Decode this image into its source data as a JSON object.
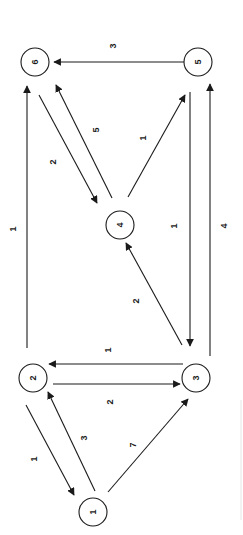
{
  "diagram": {
    "type": "directed-weighted-graph",
    "orientation": "rotated-90",
    "nodes": [
      {
        "id": "1",
        "label": "1",
        "x": 93,
        "y": 512
      },
      {
        "id": "2",
        "label": "2",
        "x": 33,
        "y": 378
      },
      {
        "id": "3",
        "label": "3",
        "x": 196,
        "y": 378
      },
      {
        "id": "4",
        "label": "4",
        "x": 120,
        "y": 225
      },
      {
        "id": "5",
        "label": "5",
        "x": 198,
        "y": 62
      },
      {
        "id": "6",
        "label": "6",
        "x": 35,
        "y": 62
      }
    ],
    "edges": [
      {
        "from": "5",
        "to": "6",
        "weight": "3",
        "x1": 184,
        "y1": 62,
        "x2": 54,
        "y2": 62,
        "lx": 113,
        "ly": 46
      },
      {
        "from": "2",
        "to": "6",
        "weight": "1",
        "x1": 27,
        "y1": 348,
        "x2": 27,
        "y2": 86,
        "lx": 13,
        "ly": 229
      },
      {
        "from": "6",
        "to": "4",
        "weight": "2",
        "x1": 39,
        "y1": 95,
        "x2": 97,
        "y2": 203,
        "lx": 53,
        "ly": 162
      },
      {
        "from": "4",
        "to": "6",
        "weight": "5",
        "x1": 112,
        "y1": 198,
        "x2": 56,
        "y2": 85,
        "lx": 96,
        "ly": 130
      },
      {
        "from": "4",
        "to": "5",
        "weight": "1",
        "x1": 128,
        "y1": 197,
        "x2": 185,
        "y2": 95,
        "lx": 143,
        "ly": 138
      },
      {
        "from": "5",
        "to": "3",
        "weight": "1",
        "x1": 190,
        "y1": 92,
        "x2": 190,
        "y2": 346,
        "lx": 174,
        "ly": 226
      },
      {
        "from": "3",
        "to": "5",
        "weight": "4",
        "x1": 210,
        "y1": 356,
        "x2": 210,
        "y2": 84,
        "lx": 224,
        "ly": 226
      },
      {
        "from": "3",
        "to": "4",
        "weight": "2",
        "x1": 182,
        "y1": 345,
        "x2": 126,
        "y2": 243,
        "lx": 136,
        "ly": 301
      },
      {
        "from": "3",
        "to": "2",
        "weight": "1",
        "x1": 183,
        "y1": 364,
        "x2": 49,
        "y2": 364,
        "lx": 108,
        "ly": 350
      },
      {
        "from": "2",
        "to": "3",
        "weight": "2",
        "x1": 53,
        "y1": 384,
        "x2": 180,
        "y2": 384,
        "lx": 110,
        "ly": 402
      },
      {
        "from": "2",
        "to": "1",
        "weight": "1",
        "x1": 26,
        "y1": 405,
        "x2": 74,
        "y2": 495,
        "lx": 34,
        "ly": 459
      },
      {
        "from": "1",
        "to": "2",
        "weight": "3",
        "x1": 95,
        "y1": 491,
        "x2": 48,
        "y2": 392,
        "lx": 84,
        "ly": 438
      },
      {
        "from": "1",
        "to": "3",
        "weight": "7",
        "x1": 108,
        "y1": 492,
        "x2": 188,
        "y2": 399,
        "lx": 133,
        "ly": 445
      }
    ]
  }
}
